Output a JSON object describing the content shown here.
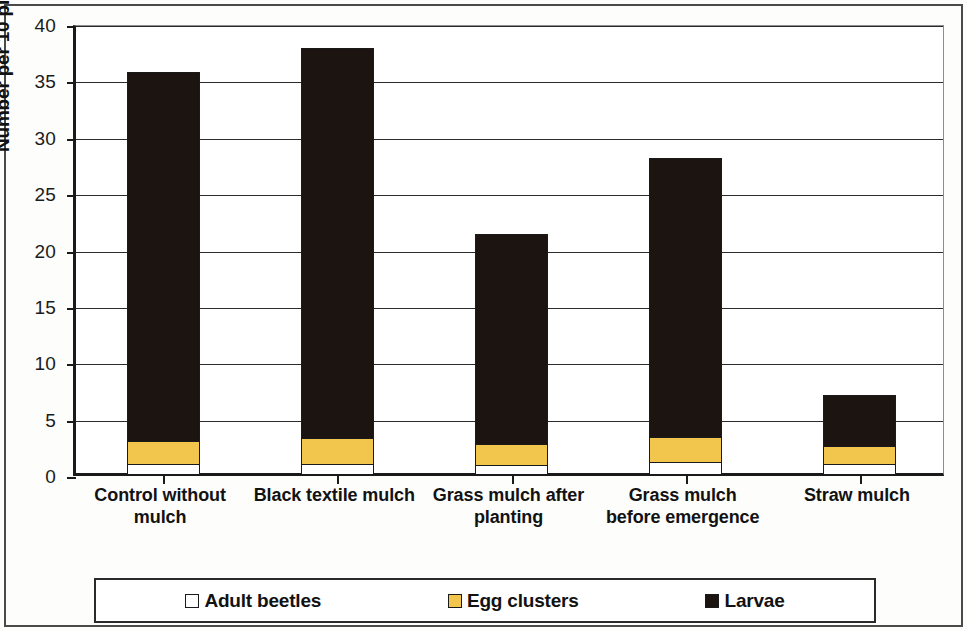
{
  "chart_data": {
    "type": "bar",
    "subtype": "stacked-column",
    "title": "",
    "xlabel": "",
    "ylabel": "Number per 10 plants",
    "ylim": [
      0,
      40
    ],
    "yticks": [
      0,
      5,
      10,
      15,
      20,
      25,
      30,
      35,
      40
    ],
    "grid": true,
    "grid_axis": "y",
    "legend_position": "bottom",
    "categories": [
      "Control without mulch",
      "Black textile mulch",
      "Grass mulch after planting",
      "Grass mulch before emergence",
      "Straw mulch"
    ],
    "category_lines": [
      [
        "Control without",
        "mulch"
      ],
      [
        "Black textile  mulch",
        ""
      ],
      [
        "Grass mulch after",
        "planting"
      ],
      [
        "Grass mulch",
        "before emergence"
      ],
      [
        "Straw mulch",
        ""
      ]
    ],
    "series": [
      {
        "name": "Adult beetles",
        "color": "#ffffff",
        "values": [
          0.9,
          0.9,
          0.8,
          1.1,
          0.9
        ]
      },
      {
        "name": "Egg clusters",
        "color": "#f2c64c",
        "values": [
          2.2,
          2.5,
          2.0,
          2.4,
          1.8
        ]
      },
      {
        "name": "Larvae",
        "color": "#1c1410",
        "values": [
          32.9,
          34.7,
          18.8,
          24.8,
          4.6
        ]
      }
    ],
    "totals": [
      36.0,
      38.1,
      21.6,
      28.3,
      7.3
    ]
  },
  "legend": {
    "entries": [
      {
        "label": "Adult beetles",
        "color": "#ffffff"
      },
      {
        "label": "Egg clusters",
        "color": "#f2c64c"
      },
      {
        "label": "Larvae",
        "color": "#1c1410"
      }
    ]
  }
}
